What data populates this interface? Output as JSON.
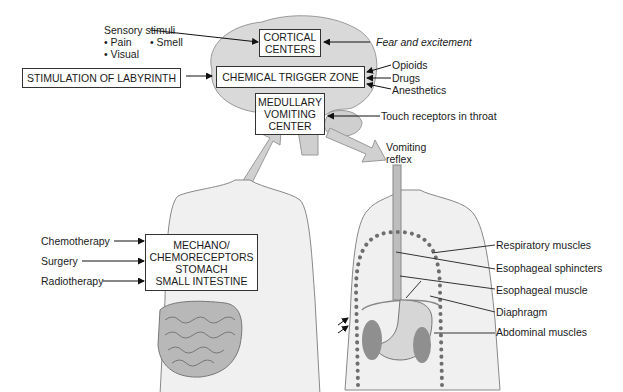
{
  "diagram": {
    "brain": {
      "sensory_stimuli": {
        "heading": "Sensory stimuli",
        "items": [
          "• Pain",
          "• Smell",
          "• Visual"
        ]
      },
      "cortical_centers": [
        "CORTICAL",
        "CENTERS"
      ],
      "fear": "Fear and excitement",
      "labyrinth": "STIMULATION OF LABYRINTH",
      "ctz": "CHEMICAL TRIGGER ZONE",
      "ctz_inputs": [
        "Opioids",
        "Drugs",
        "Anesthetics"
      ],
      "medullary": [
        "MEDULLARY",
        "VOMITING",
        "CENTER"
      ],
      "touch": "Touch receptors in throat",
      "vomiting_reflex": [
        "Vomiting",
        "reflex"
      ]
    },
    "gut": {
      "inputs": [
        "Chemotherapy",
        "Surgery",
        "Radiotherapy"
      ],
      "box": [
        "MECHANO/",
        "CHEMORECEPTORS",
        "STOMACH",
        "SMALL INTESTINE"
      ]
    },
    "reflex_muscles": [
      "Respiratory muscles",
      "Esophageal sphincters",
      "Esophageal muscle",
      "Diaphragm",
      "Abdominal muscles"
    ]
  },
  "colors": {
    "fill": "#d9d9d9",
    "outline": "#8a8a8a",
    "dots": "#6e6e6e",
    "organs": "#9a9a9a"
  }
}
